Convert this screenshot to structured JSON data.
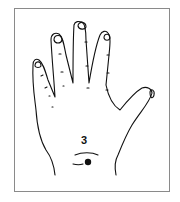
{
  "diagram": {
    "point_label": "3",
    "point_color": "#111111",
    "line_color": "#111111"
  }
}
